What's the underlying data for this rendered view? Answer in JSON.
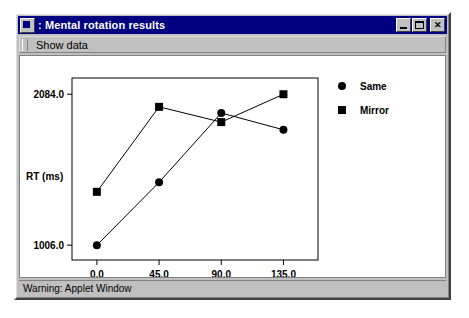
{
  "window": {
    "title": ": Mental rotation results",
    "icon": "applet-window-icon",
    "buttons": {
      "minimize": "_",
      "maximize": "□",
      "close": "✕"
    }
  },
  "menubar": {
    "items": [
      {
        "label": "Show data"
      }
    ]
  },
  "statusbar": {
    "text": "Warning: Applet Window"
  },
  "chart_data": {
    "type": "line",
    "title": "",
    "xlabel": "Rotation angle (degrees)",
    "ylabel": "RT (ms)",
    "x": [
      0.0,
      45.0,
      90.0,
      135.0
    ],
    "xtick_labels": [
      "0.0",
      "45.0",
      "90.0",
      "135.0"
    ],
    "ytick_labels": [
      "1006.0",
      "2084.0"
    ],
    "yticks": [
      1006.0,
      2084.0
    ],
    "ylim": [
      900,
      2200
    ],
    "xlim": [
      -18,
      160
    ],
    "grid": false,
    "legend_position": "right",
    "series": [
      {
        "name": "Same",
        "marker": "circle",
        "color": "#000000",
        "values": [
          1006.0,
          1455.0,
          1950.0,
          1830.0
        ]
      },
      {
        "name": "Mirror",
        "marker": "square",
        "color": "#000000",
        "values": [
          1387.0,
          1994.0,
          1885.0,
          2084.0
        ]
      }
    ]
  }
}
